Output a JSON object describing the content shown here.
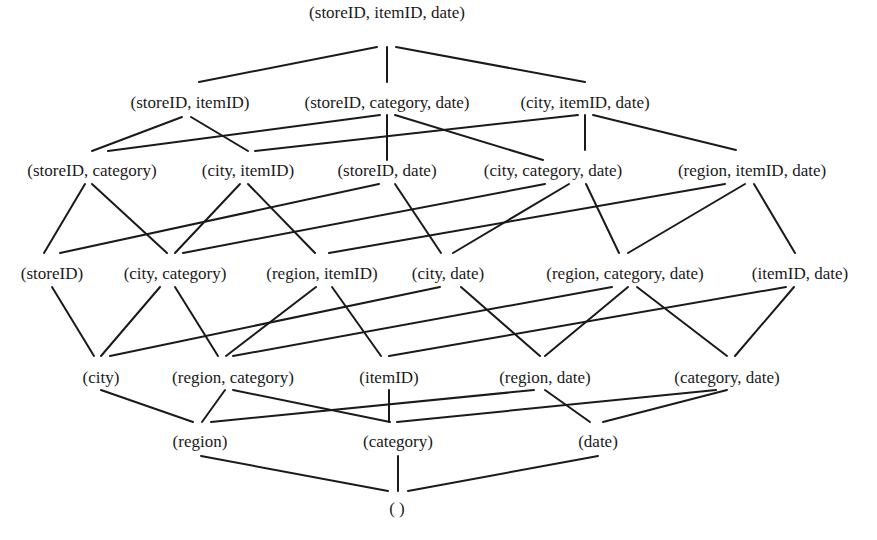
{
  "diagram": {
    "type": "lattice",
    "nodes": [
      {
        "id": "sid_iid_d",
        "label": "(storeID, itemID, date)",
        "x": 387,
        "y": 12
      },
      {
        "id": "sid_iid",
        "label": "(storeID, itemID)",
        "x": 190,
        "y": 102
      },
      {
        "id": "sid_cat_d",
        "label": "(storeID, category, date)",
        "x": 387,
        "y": 102
      },
      {
        "id": "city_iid_d",
        "label": "(city, itemID, date)",
        "x": 585,
        "y": 102
      },
      {
        "id": "sid_cat",
        "label": "(storeID, category)",
        "x": 92,
        "y": 170
      },
      {
        "id": "city_iid",
        "label": "(city, itemID)",
        "x": 248,
        "y": 170
      },
      {
        "id": "sid_d",
        "label": "(storeID, date)",
        "x": 387,
        "y": 170
      },
      {
        "id": "city_cat_d",
        "label": "(city, category, date)",
        "x": 553,
        "y": 170
      },
      {
        "id": "reg_iid_d",
        "label": "(region, itemID, date)",
        "x": 752,
        "y": 170
      },
      {
        "id": "sid",
        "label": "(storeID)",
        "x": 52,
        "y": 273
      },
      {
        "id": "city_cat",
        "label": "(city, category)",
        "x": 175,
        "y": 273
      },
      {
        "id": "reg_iid",
        "label": "(region, itemID)",
        "x": 322,
        "y": 273
      },
      {
        "id": "city_d",
        "label": "(city, date)",
        "x": 448,
        "y": 273
      },
      {
        "id": "reg_cat_d",
        "label": "(region, category, date)",
        "x": 625,
        "y": 273
      },
      {
        "id": "iid_d",
        "label": "(itemID, date)",
        "x": 800,
        "y": 273
      },
      {
        "id": "city",
        "label": "(city)",
        "x": 101,
        "y": 377
      },
      {
        "id": "reg_cat",
        "label": "(region, category)",
        "x": 233,
        "y": 377
      },
      {
        "id": "iid",
        "label": "(itemID)",
        "x": 389,
        "y": 377
      },
      {
        "id": "reg_d",
        "label": "(region, date)",
        "x": 545,
        "y": 377
      },
      {
        "id": "cat_d",
        "label": "(category, date)",
        "x": 727,
        "y": 377
      },
      {
        "id": "reg",
        "label": "(region)",
        "x": 200,
        "y": 441
      },
      {
        "id": "cat",
        "label": "(category)",
        "x": 398,
        "y": 441
      },
      {
        "id": "d",
        "label": "(date)",
        "x": 598,
        "y": 441
      },
      {
        "id": "apex",
        "label": "( )",
        "x": 397,
        "y": 508
      }
    ],
    "edges": [
      {
        "x1": 377,
        "y1": 47,
        "x2": 199,
        "y2": 82
      },
      {
        "x1": 387,
        "y1": 47,
        "x2": 387,
        "y2": 82
      },
      {
        "x1": 396,
        "y1": 47,
        "x2": 585,
        "y2": 82
      },
      {
        "x1": 182,
        "y1": 117,
        "x2": 92,
        "y2": 151
      },
      {
        "x1": 191,
        "y1": 117,
        "x2": 248,
        "y2": 151
      },
      {
        "x1": 380,
        "y1": 115,
        "x2": 108,
        "y2": 151
      },
      {
        "x1": 387,
        "y1": 115,
        "x2": 387,
        "y2": 160
      },
      {
        "x1": 395,
        "y1": 115,
        "x2": 543,
        "y2": 160
      },
      {
        "x1": 578,
        "y1": 115,
        "x2": 255,
        "y2": 151
      },
      {
        "x1": 585,
        "y1": 115,
        "x2": 585,
        "y2": 150
      },
      {
        "x1": 593,
        "y1": 115,
        "x2": 736,
        "y2": 150
      },
      {
        "x1": 85,
        "y1": 184,
        "x2": 44,
        "y2": 253
      },
      {
        "x1": 92,
        "y1": 184,
        "x2": 167,
        "y2": 253
      },
      {
        "x1": 240,
        "y1": 184,
        "x2": 175,
        "y2": 253
      },
      {
        "x1": 248,
        "y1": 184,
        "x2": 315,
        "y2": 253
      },
      {
        "x1": 379,
        "y1": 184,
        "x2": 60,
        "y2": 253
      },
      {
        "x1": 395,
        "y1": 184,
        "x2": 441,
        "y2": 253
      },
      {
        "x1": 545,
        "y1": 184,
        "x2": 183,
        "y2": 253
      },
      {
        "x1": 569,
        "y1": 184,
        "x2": 453,
        "y2": 253
      },
      {
        "x1": 586,
        "y1": 184,
        "x2": 619,
        "y2": 253
      },
      {
        "x1": 725,
        "y1": 184,
        "x2": 329,
        "y2": 253
      },
      {
        "x1": 745,
        "y1": 184,
        "x2": 628,
        "y2": 253
      },
      {
        "x1": 754,
        "y1": 184,
        "x2": 795,
        "y2": 253
      },
      {
        "x1": 52,
        "y1": 287,
        "x2": 94,
        "y2": 356
      },
      {
        "x1": 160,
        "y1": 287,
        "x2": 101,
        "y2": 356
      },
      {
        "x1": 175,
        "y1": 287,
        "x2": 218,
        "y2": 356
      },
      {
        "x1": 316,
        "y1": 287,
        "x2": 226,
        "y2": 356
      },
      {
        "x1": 332,
        "y1": 287,
        "x2": 381,
        "y2": 356
      },
      {
        "x1": 440,
        "y1": 287,
        "x2": 110,
        "y2": 356
      },
      {
        "x1": 461,
        "y1": 287,
        "x2": 540,
        "y2": 356
      },
      {
        "x1": 612,
        "y1": 287,
        "x2": 233,
        "y2": 356
      },
      {
        "x1": 628,
        "y1": 287,
        "x2": 545,
        "y2": 356
      },
      {
        "x1": 637,
        "y1": 287,
        "x2": 727,
        "y2": 356
      },
      {
        "x1": 786,
        "y1": 287,
        "x2": 389,
        "y2": 356
      },
      {
        "x1": 794,
        "y1": 287,
        "x2": 735,
        "y2": 356
      },
      {
        "x1": 101,
        "y1": 390,
        "x2": 193,
        "y2": 422
      },
      {
        "x1": 225,
        "y1": 390,
        "x2": 202,
        "y2": 422
      },
      {
        "x1": 233,
        "y1": 390,
        "x2": 390,
        "y2": 422
      },
      {
        "x1": 389,
        "y1": 390,
        "x2": 389,
        "y2": 422
      },
      {
        "x1": 534,
        "y1": 390,
        "x2": 211,
        "y2": 422
      },
      {
        "x1": 545,
        "y1": 390,
        "x2": 590,
        "y2": 422
      },
      {
        "x1": 716,
        "y1": 390,
        "x2": 397,
        "y2": 422
      },
      {
        "x1": 727,
        "y1": 390,
        "x2": 603,
        "y2": 422
      },
      {
        "x1": 201,
        "y1": 456,
        "x2": 388,
        "y2": 491
      },
      {
        "x1": 398,
        "y1": 456,
        "x2": 398,
        "y2": 491
      },
      {
        "x1": 598,
        "y1": 456,
        "x2": 408,
        "y2": 491
      }
    ]
  }
}
